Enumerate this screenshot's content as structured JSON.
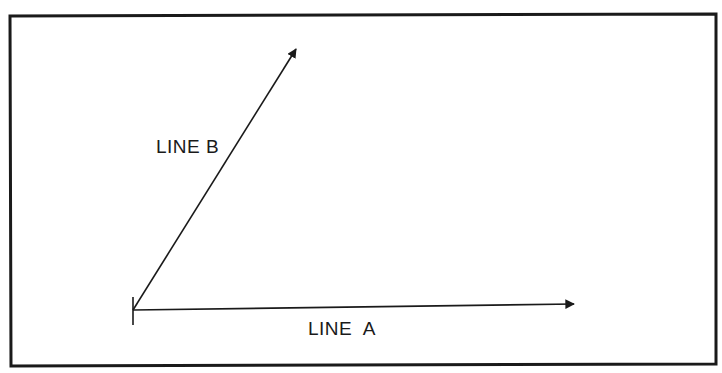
{
  "diagram": {
    "labels": {
      "line_a": "LINE  A",
      "line_b": "LINE B"
    },
    "colors": {
      "ink": "#1a1a1a",
      "background": "#ffffff"
    },
    "frame": {
      "x1": 10,
      "y1": 15,
      "x2": 716,
      "y2": 364
    },
    "origin": {
      "x": 133,
      "y": 310
    },
    "line_a": {
      "from": [
        133,
        310
      ],
      "to": [
        575,
        304
      ]
    },
    "line_b": {
      "from": [
        133,
        310
      ],
      "to": [
        297,
        48
      ]
    }
  }
}
